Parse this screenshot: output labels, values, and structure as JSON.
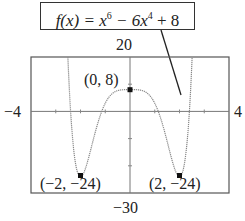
{
  "function_label": {
    "prefix": "f(x) = x",
    "exp1": "6",
    "mid": " − 6x",
    "exp2": "4",
    "suffix": " + 8"
  },
  "window": {
    "ymax_label": "20",
    "ymin_label": "−30",
    "xmin_label": "−4",
    "xmax_label": "4"
  },
  "points": [
    {
      "label": "(0, 8)",
      "x": 0,
      "y": 8
    },
    {
      "label": "(−2, −24)",
      "x": -2,
      "y": -24
    },
    {
      "label": "(2, −24)",
      "x": 2,
      "y": -24
    }
  ],
  "chart_data": {
    "type": "line",
    "xlabel": "",
    "ylabel": "",
    "xlim": [
      -4,
      4
    ],
    "ylim": [
      -30,
      20
    ],
    "grid": false,
    "legend": "none",
    "series": [
      {
        "name": "f(x) = x^6 − 6x^4 + 8",
        "x": [
          -2.85,
          -2.7,
          -2.6,
          -2.5,
          -2.4,
          -2.3,
          -2.2,
          -2.1,
          -2.0,
          -1.9,
          -1.8,
          -1.7,
          -1.6,
          -1.5,
          -1.4,
          -1.3,
          -1.2,
          -1.0,
          -0.8,
          -0.6,
          -0.4,
          -0.2,
          0,
          0.2,
          0.4,
          0.6,
          0.8,
          1.0,
          1.2,
          1.3,
          1.4,
          1.5,
          1.6,
          1.7,
          1.8,
          1.9,
          2.0,
          2.1,
          2.2,
          2.3,
          2.4,
          2.5,
          2.6,
          2.7,
          2.85
        ],
        "values": [
          19.6,
          -3.9,
          -12.8,
          -18.2,
          -21.4,
          -23.0,
          -23.7,
          -23.9,
          -24.0,
          -23.2,
          -20.9,
          -17.1,
          -12.5,
          -7.0,
          -2.6,
          1.7,
          5.1,
          3.0,
          5.8,
          7.3,
          7.85,
          7.99,
          8,
          7.99,
          7.85,
          7.3,
          5.8,
          3.0,
          5.1,
          1.7,
          -2.6,
          -7.0,
          -12.5,
          -17.1,
          -20.9,
          -23.2,
          -24.0,
          -23.9,
          -23.7,
          -23.0,
          -21.4,
          -18.2,
          -12.8,
          -3.9,
          19.6
        ]
      }
    ],
    "annotations": [
      {
        "text": "(0, 8)",
        "x": 0,
        "y": 8,
        "type": "relative maximum"
      },
      {
        "text": "(−2, −24)",
        "x": -2,
        "y": -24,
        "type": "relative minimum"
      },
      {
        "text": "(2, −24)",
        "x": 2,
        "y": -24,
        "type": "relative minimum"
      },
      {
        "text": "f(x) = x^6 − 6x^4 + 8",
        "type": "callout label"
      }
    ],
    "window_labels": {
      "xmin": "−4",
      "xmax": "4",
      "ymin": "−30",
      "ymax": "20"
    }
  }
}
